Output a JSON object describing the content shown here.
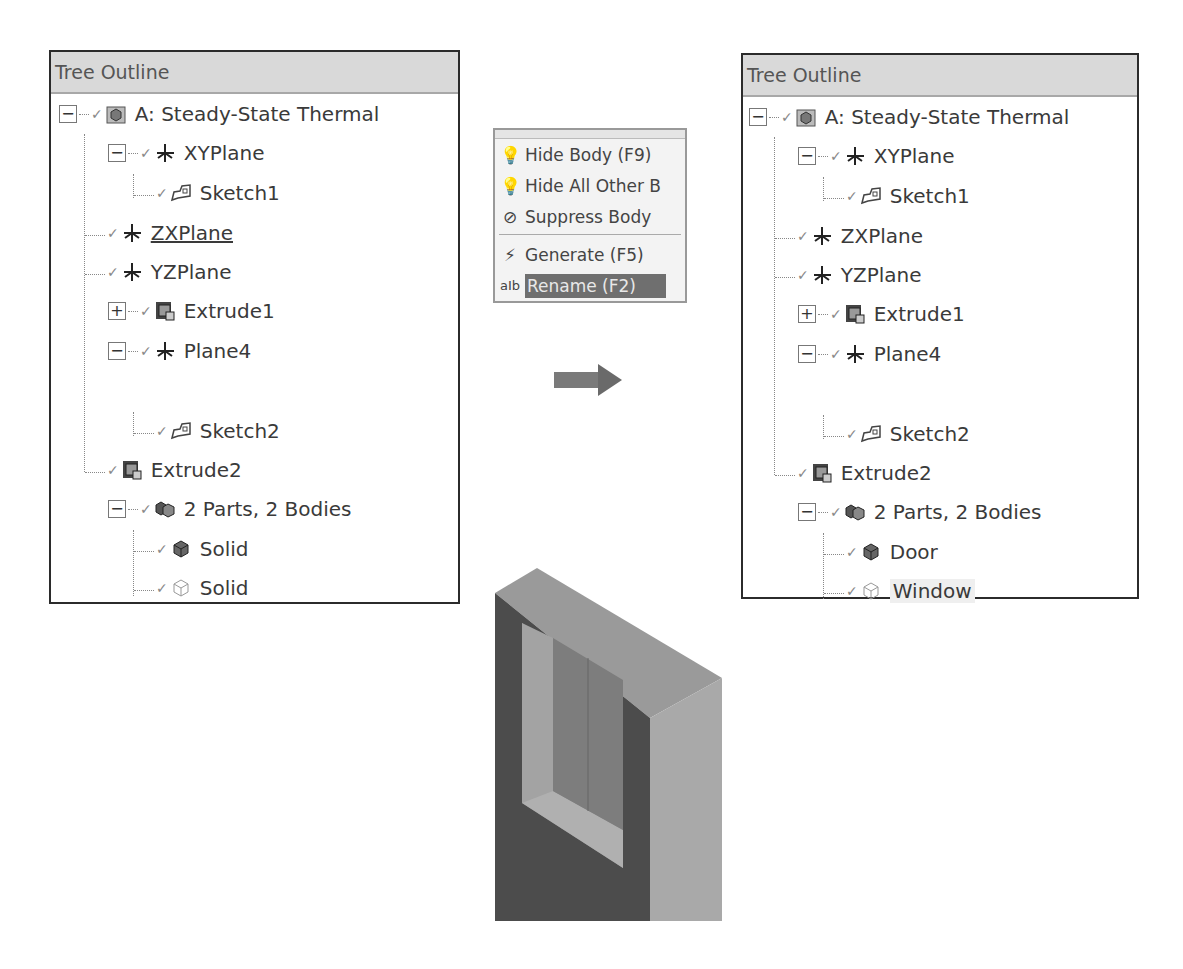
{
  "left_panel": {
    "title": "Tree Outline",
    "items": [
      {
        "label": "A: Steady-State Thermal",
        "icon": "model-icon",
        "expander": "minus"
      },
      {
        "label": "XYPlane",
        "icon": "plane-icon",
        "expander": "minus"
      },
      {
        "label": "Sketch1",
        "icon": "sketch-icon"
      },
      {
        "label": "ZXPlane",
        "icon": "plane-icon",
        "underlined": true
      },
      {
        "label": "YZPlane",
        "icon": "plane-icon"
      },
      {
        "label": "Extrude1",
        "icon": "extrude-icon",
        "expander": "plus"
      },
      {
        "label": "Plane4",
        "icon": "plane-icon",
        "expander": "minus"
      },
      {
        "label": "Sketch2",
        "icon": "sketch-icon"
      },
      {
        "label": "Extrude2",
        "icon": "extrude-icon"
      },
      {
        "label": "2 Parts, 2 Bodies",
        "icon": "parts-icon",
        "expander": "minus"
      },
      {
        "label": "Solid",
        "icon": "solid-body-icon"
      },
      {
        "label": "Solid",
        "icon": "hidden-body-icon"
      }
    ]
  },
  "context_menu": {
    "items": [
      {
        "label": "Hide Body (F9)",
        "icon": "lightbulb-icon"
      },
      {
        "label": "Hide All Other B",
        "icon": "lightbulb-icon"
      },
      {
        "label": "Suppress Body",
        "icon": "suppress-icon"
      },
      {
        "label": "Generate (F5)",
        "icon": "generate-icon"
      },
      {
        "label": "Rename (F2)",
        "icon": "rename-icon",
        "selected": true
      }
    ]
  },
  "right_panel": {
    "title": "Tree Outline",
    "items": [
      {
        "label": "A: Steady-State Thermal"
      },
      {
        "label": "XYPlane"
      },
      {
        "label": "Sketch1"
      },
      {
        "label": "ZXPlane"
      },
      {
        "label": "YZPlane"
      },
      {
        "label": "Extrude1"
      },
      {
        "label": "Plane4"
      },
      {
        "label": "Sketch2"
      },
      {
        "label": "Extrude2"
      },
      {
        "label": "2 Parts, 2 Bodies"
      },
      {
        "label": "Door"
      },
      {
        "label": "Window"
      }
    ]
  },
  "colors": {
    "header_bg": "#d9d9d9",
    "menu_selected_bg": "#6f6f6f",
    "arrow": "#7a7a7a",
    "model_dark": "#4a4a4a",
    "model_mid": "#8a8a8a",
    "model_light": "#a8a8a8"
  }
}
